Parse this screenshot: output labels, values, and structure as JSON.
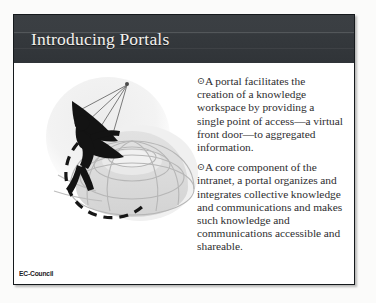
{
  "slide": {
    "title": "Introducing Portals",
    "bullet_glyph": "⊙",
    "bullets": [
      "A portal facilitates the creation of a knowledge workspace by providing a single point of access—a virtual front door—to aggregated information.",
      "A core component of the intranet, a portal organizes and integrates collective knowledge and communications and makes such knowledge and communications accessible and shareable."
    ],
    "footer": "EC-Council",
    "illustration": {
      "name": "person-with-antenna-over-wireframe-dome",
      "alt": "Stylized dark human figure holding a radiating antenna, standing beside a dashed arc over a light gray wireframe dome/globe"
    },
    "colors": {
      "title_bar": "#3a3e42",
      "title_text": "#f4f2ee",
      "body_text": "#2e2e30",
      "slide_border": "#15191c",
      "slide_background": "#ffffff",
      "illustration_dark": "#141414",
      "illustration_light": "#d8d8d8",
      "footer_text": "#1d2023"
    }
  }
}
